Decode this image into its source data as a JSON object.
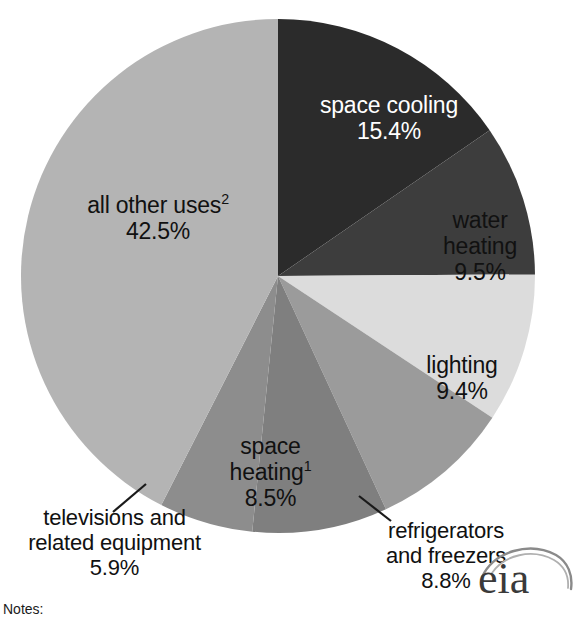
{
  "chart_data": {
    "type": "pie",
    "title": "",
    "subtitle": "",
    "xlabel": "",
    "ylabel": "",
    "legend_position": "none",
    "grid": false,
    "unit": "%",
    "start_angle_deg": 0,
    "direction": "clockwise",
    "center": {
      "x": 278,
      "y": 276,
      "radius": 257
    },
    "categories": [
      "space cooling",
      "water heating",
      "lighting",
      "refrigerators and freezers",
      "space heating",
      "televisions and related equipment",
      "all other uses"
    ],
    "values": [
      15.4,
      9.5,
      9.4,
      8.8,
      8.5,
      5.9,
      42.5
    ],
    "slices": [
      {
        "key": "space-cooling",
        "label": "space cooling",
        "value_text": "15.4%",
        "value": 15.4,
        "color": "#2b2b2b",
        "text_color": "#ffffff",
        "footnote": "",
        "leader_line": false
      },
      {
        "key": "water-heating",
        "label": "water heating",
        "label_line1": "water",
        "label_line2": "heating",
        "value_text": "9.5%",
        "value": 9.5,
        "color": "#3d3d3d",
        "text_color": "#111111",
        "footnote": "",
        "leader_line": false
      },
      {
        "key": "lighting",
        "label": "lighting",
        "value_text": "9.4%",
        "value": 9.4,
        "color": "#dcdcdc",
        "text_color": "#111111",
        "footnote": "",
        "leader_line": false
      },
      {
        "key": "refrigerators-and-freezers",
        "label": "refrigerators and freezers",
        "label_line1": "refrigerators",
        "label_line2": "and freezers",
        "value_text": "8.8%",
        "value": 8.8,
        "color": "#9b9b9b",
        "text_color": "#111111",
        "footnote": "",
        "leader_line": true
      },
      {
        "key": "space-heating",
        "label": "space heating",
        "label_line1": "space",
        "label_line2": "heating",
        "value_text": "8.5%",
        "value": 8.5,
        "color": "#7f7f7f",
        "text_color": "#111111",
        "footnote": "1",
        "leader_line": false
      },
      {
        "key": "televisions-and-related-equipment",
        "label": "televisions and related equipment",
        "label_line1": "televisions and",
        "label_line2": "related equipment",
        "value_text": "5.9%",
        "value": 5.9,
        "color": "#8d8d8d",
        "text_color": "#111111",
        "footnote": "",
        "leader_line": true
      },
      {
        "key": "all-other-uses",
        "label": "all other uses",
        "value_text": "42.5%",
        "value": 42.5,
        "color": "#b4b4b4",
        "text_color": "#111111",
        "footnote": "2",
        "leader_line": false
      }
    ]
  },
  "footer": {
    "notes_label": "Notes:"
  },
  "branding": {
    "logo_text": "eia",
    "logo_name": "eia-logo"
  }
}
